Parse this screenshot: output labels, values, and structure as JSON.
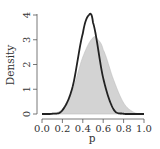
{
  "chart_data": {
    "type": "area",
    "title": "",
    "xlabel": "p",
    "ylabel": "Density",
    "xlim": [
      0.0,
      1.0
    ],
    "ylim": [
      0,
      4
    ],
    "xticks": [
      "0.0",
      "0.2",
      "0.4",
      "0.6",
      "0.8",
      "1.0"
    ],
    "yticks": [
      "0",
      "1",
      "2",
      "3",
      "4"
    ],
    "grid": false,
    "legend": null,
    "series": [
      {
        "name": "filled density",
        "style": "filled-area",
        "fill": "#d3d3d3",
        "stroke": "#b8b8b8",
        "peak_x": 0.51,
        "peak_y": 3.1,
        "support": [
          0.15,
          0.92
        ],
        "x": [
          0.0,
          0.1,
          0.2,
          0.3,
          0.4,
          0.5,
          0.55,
          0.6,
          0.7,
          0.8,
          0.9,
          1.0
        ],
        "y": [
          0.0,
          0.02,
          0.2,
          0.95,
          2.3,
          3.08,
          3.0,
          2.6,
          1.4,
          0.45,
          0.07,
          0.0
        ]
      },
      {
        "name": "line density",
        "style": "line",
        "stroke": "#222222",
        "peak_x": 0.46,
        "peak_y": 4.0,
        "support": [
          0.1,
          0.86
        ],
        "x": [
          0.0,
          0.1,
          0.2,
          0.3,
          0.4,
          0.46,
          0.5,
          0.6,
          0.7,
          0.8,
          0.9,
          1.0
        ],
        "y": [
          0.0,
          0.01,
          0.15,
          1.1,
          3.25,
          4.0,
          3.7,
          1.45,
          0.2,
          0.01,
          0.0,
          0.0
        ]
      }
    ]
  },
  "axes": {
    "x_title": "p",
    "y_title": "Density",
    "x_ticks": [
      "0.0",
      "0.2",
      "0.4",
      "0.6",
      "0.8",
      "1.0"
    ],
    "y_ticks": [
      "0",
      "1",
      "2",
      "3",
      "4"
    ]
  }
}
